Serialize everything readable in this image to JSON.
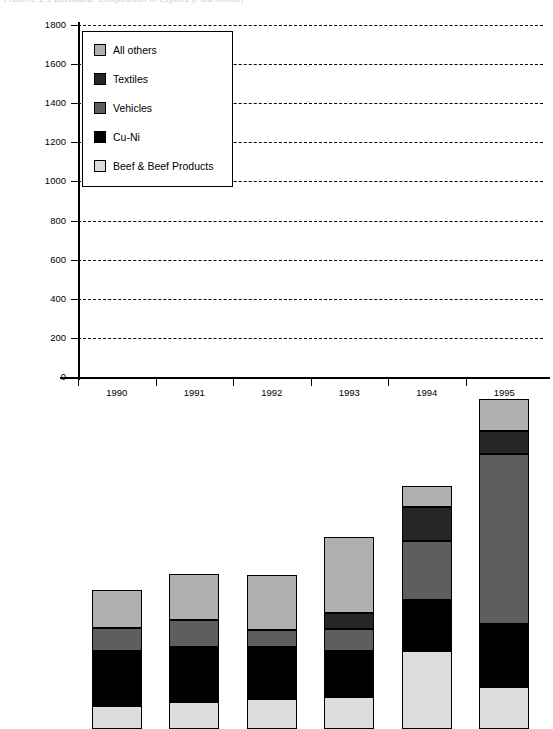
{
  "title_clipped": "FIGURE 2.1   Botswana:  Composition of Exports  (Pula million)",
  "axis": {
    "ylabel": "Pula million",
    "yticks": [
      0,
      200,
      400,
      600,
      800,
      1000,
      1200,
      1400,
      1600,
      1800
    ],
    "ylim": [
      0,
      1800
    ],
    "xlabels": [
      "1990",
      "1991",
      "1992",
      "1993",
      "1994",
      "1995"
    ]
  },
  "legend": {
    "items": [
      {
        "label": "All others",
        "color": "#b0b0b0"
      },
      {
        "label": "Textiles",
        "color": "#262626"
      },
      {
        "label": "Vehicles",
        "color": "#5e5e5e"
      },
      {
        "label": "Cu-Ni",
        "color": "#000000"
      },
      {
        "label": "Beef & Beef Products",
        "color": "#dcdcdc"
      }
    ]
  },
  "chart_data": {
    "type": "bar",
    "stacked": true,
    "title": "Botswana: Composition of Exports",
    "xlabel": "",
    "ylabel": "Pula million",
    "ylim": [
      0,
      1800
    ],
    "ytick_step": 200,
    "grid": true,
    "legend_position": "upper-left-inset",
    "categories": [
      "1990",
      "1991",
      "1992",
      "1993",
      "1994",
      "1995"
    ],
    "series": [
      {
        "name": "Beef & Beef Products",
        "color": "#dcdcdc",
        "values": [
          120,
          140,
          155,
          165,
          400,
          215
        ]
      },
      {
        "name": "Cu-Ni",
        "color": "#000000",
        "values": [
          280,
          280,
          265,
          235,
          260,
          320
        ]
      },
      {
        "name": "Vehicles",
        "color": "#5e5e5e",
        "values": [
          115,
          135,
          85,
          110,
          300,
          870
        ]
      },
      {
        "name": "Textiles",
        "color": "#262626",
        "values": [
          0,
          0,
          0,
          85,
          175,
          120
        ]
      },
      {
        "name": "All others",
        "color": "#b0b0b0",
        "values": [
          195,
          240,
          285,
          385,
          110,
          160
        ]
      }
    ],
    "totals": [
      710,
      795,
      790,
      980,
      1245,
      1685
    ]
  }
}
